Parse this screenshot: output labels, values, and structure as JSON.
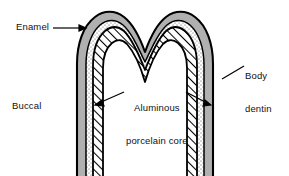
{
  "figure": {
    "background_color": "#ffffff"
  },
  "labels": {
    "enamel": "Enamel",
    "buccal": "Buccal",
    "body_dentin_line1": "Body",
    "body_dentin_line2": "dentin",
    "core_line1": "Aluminous",
    "core_line2": "porcelain core"
  },
  "layers": [
    {
      "name": "enamel",
      "label": "Enamel",
      "fill_style": "solid-gray",
      "color": "#b0b0b0",
      "position": "outer"
    },
    {
      "name": "body-dentin",
      "label": "Body dentin",
      "fill_style": "stippled",
      "color": "#ffffff",
      "position": "middle"
    },
    {
      "name": "aluminous-porcelain-core",
      "label": "Aluminous porcelain core",
      "fill_style": "diagonal-hatch",
      "color": "#ffffff",
      "position": "inner"
    }
  ],
  "colors": {
    "outline": "#000000",
    "enamel_fill": "#b0b0b0",
    "hatch_line": "#000000",
    "stipple_dot": "#555555",
    "leader_line": "#000000",
    "text": "#111111"
  },
  "leaders": [
    {
      "name": "enamel-leader",
      "from": "Enamel label",
      "to": "enamel layer",
      "arrow": true
    },
    {
      "name": "body-dentin-leader",
      "from": "Body dentin label",
      "to": "dentin layer",
      "arrow": false
    },
    {
      "name": "core-leader-left",
      "from": "core label",
      "to": "core layer",
      "arrow": true
    },
    {
      "name": "core-leader-right",
      "from": "core label",
      "to": "core layer",
      "arrow": true
    }
  ]
}
